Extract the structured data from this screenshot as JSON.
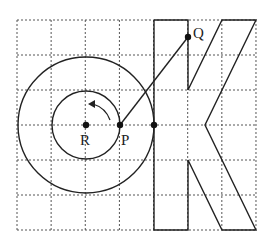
{
  "diagram": {
    "grid": {
      "x0": 17,
      "y0": 20,
      "cell_w": 34.14,
      "cell_h": 35,
      "cols": 7,
      "rows": 6,
      "color": "#555555"
    },
    "points": [
      {
        "label": "R",
        "x": 86,
        "y": 125
      },
      {
        "label": "P",
        "x": 120,
        "y": 125
      },
      {
        "label": "",
        "x": 154,
        "y": 125
      },
      {
        "label": "Q",
        "x": 188,
        "y": 37
      }
    ],
    "labels": {
      "R": "R",
      "P": "P",
      "Q": "Q"
    },
    "circles": [
      {
        "name": "inner",
        "cx": 86,
        "cy": 125,
        "r": 34
      },
      {
        "name": "outer",
        "cx": 86,
        "cy": 125,
        "r": 68
      }
    ],
    "segments": [
      {
        "from": "P",
        "to": "Q"
      }
    ],
    "rotation_arrow": {
      "center": "R",
      "direction": "counterclockwise"
    },
    "shape": "letter-K"
  }
}
